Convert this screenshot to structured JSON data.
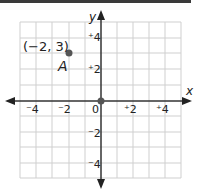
{
  "figure": {
    "x_axis_label": "x",
    "y_axis_label": "y",
    "x_ticks": [
      "⁻4",
      "⁻2",
      "0",
      "⁺2",
      "⁺4"
    ],
    "y_ticks": [
      "⁺4",
      "⁺2",
      "⁻2",
      "⁻4"
    ],
    "origin_label": "0",
    "point": {
      "name": "A",
      "coord_label": "(−2, 3)",
      "x": -2,
      "y": 3
    },
    "grid": {
      "xmin": -5,
      "xmax": 5,
      "ymin": -5,
      "ymax": 5,
      "step": 1
    },
    "colors": {
      "grid": "#c8c8c8",
      "axis": "#333333",
      "point": "#555555"
    }
  }
}
